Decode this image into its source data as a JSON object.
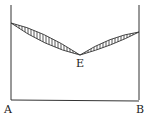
{
  "diagram": {
    "type": "eutectic-phase-diagram",
    "labels": {
      "left_component": "A",
      "right_component": "B",
      "eutectic_point": "E"
    },
    "geometry": {
      "left_axis": {
        "x": 11,
        "y_top": 5,
        "y_bottom": 100
      },
      "right_axis": {
        "x": 139,
        "y_top": 5,
        "y_bottom": 100
      },
      "baseline_y": 100,
      "left_melting_point": {
        "x": 11,
        "y": 23
      },
      "right_melting_point": {
        "x": 139,
        "y": 32
      },
      "eutectic": {
        "x": 80,
        "y": 55
      }
    },
    "colors": {
      "line": "#333333",
      "hatch": "#444444",
      "background": "#ffffff"
    }
  }
}
